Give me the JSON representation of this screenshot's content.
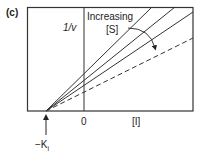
{
  "panel_label": "(c)",
  "y_axis_label": "1/v",
  "x_axis_label": "[I]",
  "origin_label": "0",
  "intercept_label": "−K",
  "intercept_subscript": "i",
  "annotation": {
    "line1": "Increasing",
    "line2": "[S]"
  },
  "colors": {
    "line": "#333333",
    "frame": "#333333",
    "background": "#ffffff"
  },
  "lines": [
    {
      "style": "solid",
      "x1": 46,
      "y1": 111,
      "x2": 152,
      "y2": 7
    },
    {
      "style": "solid",
      "x1": 46,
      "y1": 111,
      "x2": 175,
      "y2": 7
    },
    {
      "style": "solid",
      "x1": 46,
      "y1": 111,
      "x2": 193,
      "y2": 12
    },
    {
      "style": "dashed",
      "x1": 46,
      "y1": 111,
      "x2": 193,
      "y2": 38
    }
  ]
}
